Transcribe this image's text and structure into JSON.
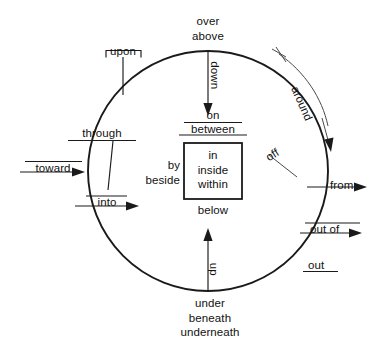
{
  "diagram": {
    "type": "concept-circle-diagram",
    "colors": {
      "ink": "#1a1a1a",
      "background": "#ffffff",
      "secondary_ink": "#4a4a4a"
    },
    "shapes": {
      "circle": {
        "cx": 208,
        "cy": 171,
        "r": 120
      },
      "inner_box": {
        "x": 184,
        "y": 143,
        "width": 58,
        "height": 56
      }
    },
    "inner_box_labels": {
      "line1": "in",
      "line2": "inside",
      "line3": "within"
    },
    "above_box": {
      "on": "on",
      "between": "between"
    },
    "left_of_box": {
      "by": "by",
      "beside": "beside"
    },
    "below_box": {
      "below": "below"
    },
    "top": {
      "over": "over",
      "above": "above",
      "down": "down"
    },
    "bottom": {
      "under": "under",
      "beneath": "beneath",
      "underneath": "underneath",
      "up": "up"
    },
    "left": {
      "upon": "upon",
      "through": "through",
      "toward": "toward",
      "into": "into"
    },
    "right": {
      "around": "around",
      "off": "off",
      "from": "from",
      "out_of": "out of",
      "out": "out"
    }
  }
}
